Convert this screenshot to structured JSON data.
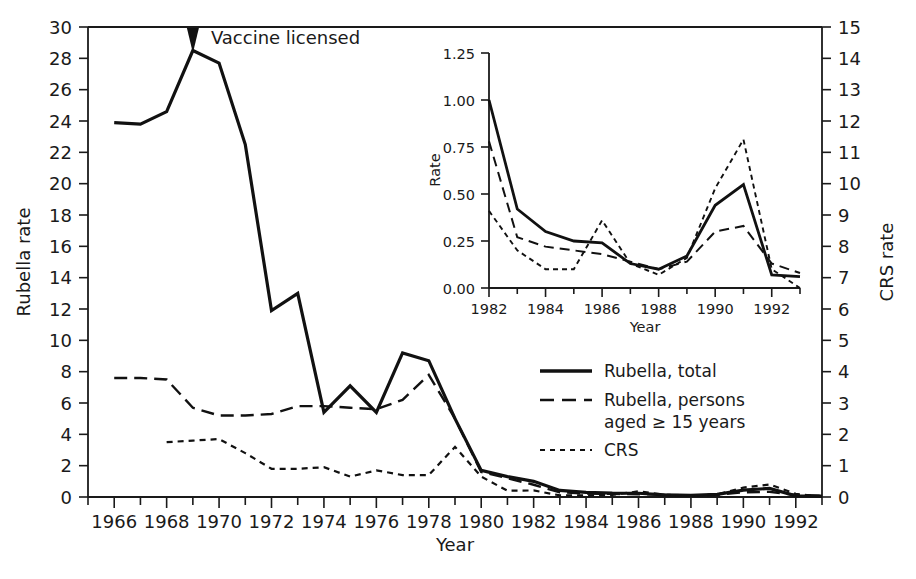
{
  "chart_data": {
    "type": "line",
    "title": "",
    "xlabel": "Year",
    "ylabel": "Rubella rate",
    "y2label": "CRS rate",
    "xlim": [
      1965,
      1993
    ],
    "ylim": [
      0,
      30
    ],
    "y2lim": [
      0,
      15
    ],
    "grid": false,
    "legend_position": "center-right",
    "x_ticks": [
      1966,
      1968,
      1970,
      1972,
      1974,
      1976,
      1978,
      1980,
      1982,
      1984,
      1986,
      1988,
      1990,
      1992
    ],
    "y_ticks": [
      0,
      2,
      4,
      6,
      8,
      10,
      12,
      14,
      16,
      18,
      20,
      22,
      24,
      26,
      28,
      30
    ],
    "y2_ticks": [
      0,
      1,
      2,
      3,
      4,
      5,
      6,
      7,
      8,
      9,
      10,
      11,
      12,
      13,
      14,
      15
    ],
    "x": [
      1966,
      1967,
      1968,
      1969,
      1970,
      1971,
      1972,
      1973,
      1974,
      1975,
      1976,
      1977,
      1978,
      1979,
      1980,
      1981,
      1982,
      1983,
      1984,
      1985,
      1986,
      1987,
      1988,
      1989,
      1990,
      1991,
      1992,
      1993
    ],
    "series": [
      {
        "name": "Rubella, total",
        "style": "solid",
        "axis": "left",
        "values": [
          23.9,
          23.8,
          24.6,
          28.5,
          27.7,
          22.5,
          11.9,
          13.0,
          5.4,
          7.1,
          5.4,
          9.2,
          8.7,
          5.0,
          1.7,
          1.3,
          1.0,
          0.42,
          0.3,
          0.25,
          0.24,
          0.13,
          0.1,
          0.17,
          0.44,
          0.55,
          0.07,
          0.06
        ]
      },
      {
        "name": "Rubella, persons aged ≥ 15 years",
        "style": "long-dash",
        "axis": "left",
        "values": [
          7.6,
          7.6,
          7.5,
          5.7,
          5.2,
          5.2,
          5.3,
          5.8,
          5.8,
          5.7,
          5.6,
          6.2,
          7.8,
          5.0,
          1.6,
          1.2,
          0.78,
          0.3,
          0.22,
          0.2,
          0.18,
          0.14,
          0.1,
          0.14,
          0.3,
          0.33,
          0.13,
          0.08
        ]
      },
      {
        "name": "CRS",
        "style": "short-dash",
        "axis": "right",
        "values": [
          null,
          null,
          1.75,
          1.8,
          1.85,
          1.4,
          0.9,
          0.9,
          0.95,
          0.65,
          0.85,
          0.7,
          0.7,
          1.6,
          0.65,
          0.2,
          0.21,
          0.05,
          0.05,
          0.07,
          0.18,
          0.07,
          0.05,
          0.08,
          0.3,
          0.4,
          0.1,
          0.0
        ]
      }
    ],
    "annotations": [
      {
        "text": "Vaccine licensed",
        "x": 1969,
        "y": 30,
        "marker": "down-arrow"
      }
    ],
    "inset": {
      "type": "line",
      "xlabel": "Year",
      "ylabel": "Rate",
      "xlim": [
        1982,
        1993
      ],
      "ylim": [
        0.0,
        1.25
      ],
      "grid": false,
      "x_ticks": [
        1982,
        1984,
        1986,
        1988,
        1990,
        1992
      ],
      "y_ticks": [
        "0.00",
        "0.25",
        "0.50",
        "0.75",
        "1.00",
        "1.25"
      ],
      "x": [
        1982,
        1983,
        1984,
        1985,
        1986,
        1987,
        1988,
        1989,
        1990,
        1991,
        1992,
        1993
      ],
      "series": [
        {
          "name": "Rubella, total",
          "style": "solid",
          "values": [
            1.0,
            0.42,
            0.3,
            0.25,
            0.24,
            0.13,
            0.1,
            0.17,
            0.44,
            0.55,
            0.07,
            0.06
          ]
        },
        {
          "name": "Rubella, persons aged ≥ 15 years",
          "style": "long-dash",
          "values": [
            0.78,
            0.27,
            0.22,
            0.2,
            0.18,
            0.14,
            0.1,
            0.14,
            0.3,
            0.33,
            0.13,
            0.08
          ]
        },
        {
          "name": "CRS",
          "style": "short-dash",
          "values": [
            0.41,
            0.2,
            0.1,
            0.1,
            0.36,
            0.13,
            0.07,
            0.16,
            0.53,
            0.79,
            0.1,
            0.0
          ]
        }
      ]
    },
    "legend": [
      {
        "label_line1": "Rubella, total",
        "label_line2": "",
        "style": "solid"
      },
      {
        "label_line1": "Rubella, persons",
        "label_line2": "aged ≥ 15 years",
        "style": "long-dash"
      },
      {
        "label_line1": "CRS",
        "label_line2": "",
        "style": "short-dash"
      }
    ]
  }
}
